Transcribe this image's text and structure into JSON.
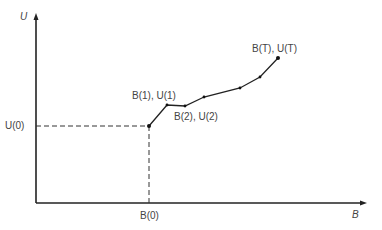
{
  "diagram": {
    "axes": {
      "y_label": "U",
      "x_label": "B"
    },
    "labels": {
      "u0": "U(0)",
      "b0": "B(0)",
      "p1": "B(1), U(1)",
      "p2": "B(2), U(2)",
      "pT": "B(T), U(T)"
    },
    "colors": {
      "line": "#222222",
      "text": "#444444"
    }
  }
}
